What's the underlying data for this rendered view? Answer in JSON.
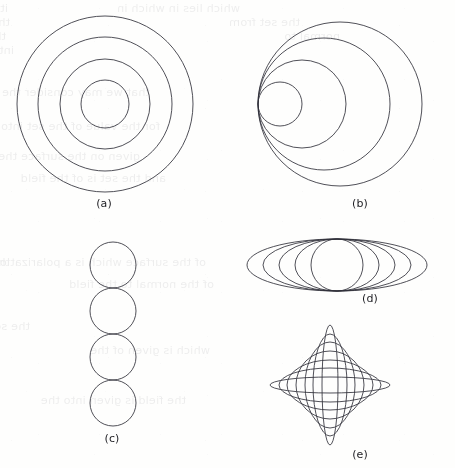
{
  "figure": {
    "kind": "geometry-diagram",
    "ink_color": "#30303a",
    "paper_color": "#fefefd",
    "panels": [
      {
        "id": "a",
        "caption": "(a)",
        "caption_x": 74,
        "caption_y": 197,
        "type": "concentric-circles",
        "center": [
          105,
          104
        ],
        "radii": [
          88,
          67,
          45,
          24
        ],
        "count": 4
      },
      {
        "id": "b",
        "caption": "(b)",
        "caption_x": 330,
        "caption_y": 197,
        "type": "internally-tangent-circles",
        "tangent_point": [
          258,
          104
        ],
        "radii": [
          82,
          66,
          44,
          22
        ],
        "count": 4,
        "note": "all circles tangent at the common left-hand point"
      },
      {
        "id": "c",
        "caption": "(c)",
        "caption_x": 82,
        "caption_y": 432,
        "type": "tangent-circle-chain",
        "center_x": 113,
        "top_y": 242,
        "radius": 23,
        "count": 4,
        "note": "four equal circles stacked vertically, each tangent to the next"
      },
      {
        "id": "d",
        "caption": "(d)",
        "caption_x": 340,
        "caption_y": 292,
        "type": "confocal-ellipse-family",
        "center": [
          337,
          265
        ],
        "semi_minor": 26,
        "semi_major_values": [
          26,
          42,
          58,
          74,
          90
        ],
        "count": 5,
        "note": "common vertical semi-axis, increasing horizontal semi-axis; innermost is a circle"
      },
      {
        "id": "e",
        "caption": "(e)",
        "caption_x": 330,
        "caption_y": 448,
        "type": "astroid-envelope-ellipses",
        "center": [
          330,
          385
        ],
        "sum_of_semi_axes": 68,
        "semi_axis_pairs": [
          [
            8,
            60
          ],
          [
            17,
            51
          ],
          [
            25,
            43
          ],
          [
            34,
            34
          ],
          [
            43,
            25
          ],
          [
            51,
            17
          ],
          [
            60,
            8
          ]
        ],
        "count": 7,
        "note": "family of ellipses with a + b constant, enveloping an astroid"
      }
    ]
  },
  "bleed_through": {
    "visible": true,
    "opacity": "0.085",
    "note": "faint mirrored text showing through from the reverse side of the page",
    "lines": [
      {
        "x": 8,
        "y": 2,
        "text": "it was as a single particle from the field"
      },
      {
        "x": 240,
        "y": 2,
        "text": "which lies in which in"
      },
      {
        "x": 10,
        "y": 16,
        "text": "that we may write that a field originates from"
      },
      {
        "x": 300,
        "y": 16,
        "text": "the set from"
      },
      {
        "x": 6,
        "y": 30,
        "text": "the surface is to be polarized from the field"
      },
      {
        "x": 340,
        "y": 30,
        "text": "normal to"
      },
      {
        "x": 14,
        "y": 44,
        "text": "into it and given"
      },
      {
        "x": 150,
        "y": 86,
        "text": "that we may consider the uniform"
      },
      {
        "x": 160,
        "y": 120,
        "text": "for the value of the set into"
      },
      {
        "x": 140,
        "y": 150,
        "text": "given on the surface the field"
      },
      {
        "x": 166,
        "y": 172,
        "text": "and the set is of the field"
      },
      {
        "x": 10,
        "y": 256,
        "text": "the quantities may be"
      },
      {
        "x": 206,
        "y": 256,
        "text": "of the surface which is a polarization"
      },
      {
        "x": 214,
        "y": 278,
        "text": "of the normal to the field"
      },
      {
        "x": 30,
        "y": 320,
        "text": "the set of a surface may"
      },
      {
        "x": 210,
        "y": 344,
        "text": "which is given of the"
      },
      {
        "x": 186,
        "y": 394,
        "text": "the field is given into the"
      }
    ]
  }
}
